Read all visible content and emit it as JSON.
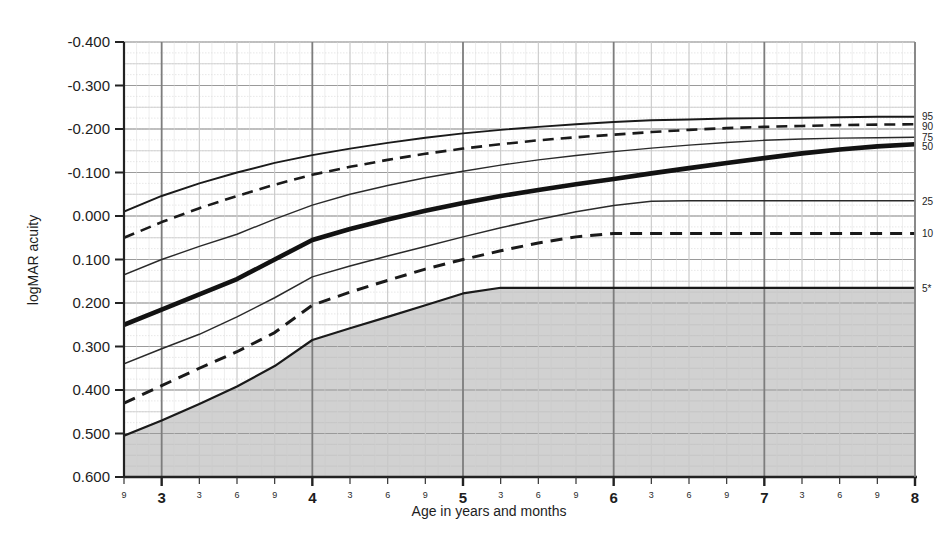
{
  "chart_data": {
    "type": "line",
    "title": "",
    "xlabel": "Age in years and months",
    "ylabel": "logMAR acuity",
    "ylim": [
      -0.4,
      0.6
    ],
    "xlim": [
      2.75,
      8.0
    ],
    "y_inverted": true,
    "grid": true,
    "legend_position": "right-axis-labels",
    "y_ticks": [
      "-0.400",
      "-0.300",
      "-0.200",
      "-0.100",
      "0.000",
      "0.100",
      "0.200",
      "0.300",
      "0.400",
      "0.500",
      "0.600"
    ],
    "y_tick_values": [
      -0.4,
      -0.3,
      -0.2,
      -0.1,
      0.0,
      0.1,
      0.2,
      0.3,
      0.4,
      0.5,
      0.6
    ],
    "x_year_ticks": [
      "3",
      "4",
      "5",
      "6",
      "7",
      "8"
    ],
    "x_year_values": [
      3,
      4,
      5,
      6,
      7,
      8
    ],
    "x_month_ticks": [
      "9",
      "3",
      "6",
      "9",
      "3",
      "6",
      "9",
      "3",
      "6",
      "9",
      "3",
      "6",
      "9",
      "3",
      "6",
      "9"
    ],
    "x_month_values": [
      2.75,
      3.25,
      3.5,
      3.75,
      4.25,
      4.5,
      4.75,
      5.25,
      5.5,
      5.75,
      6.25,
      6.5,
      6.75,
      7.25,
      7.5,
      7.75
    ],
    "shaded_region_label": "below 5th percentile",
    "shaded_region_color": "#cfcfcf",
    "x": [
      2.75,
      3.0,
      3.25,
      3.5,
      3.75,
      4.0,
      4.25,
      4.5,
      4.75,
      5.0,
      5.25,
      5.5,
      5.75,
      6.0,
      6.25,
      6.5,
      6.75,
      7.0,
      7.25,
      7.5,
      7.75,
      8.0
    ],
    "series": [
      {
        "name": "95",
        "label": "95",
        "style": "solid",
        "width": 1.9,
        "color": "#1a1a1a",
        "values": [
          -0.01,
          -0.046,
          -0.075,
          -0.1,
          -0.122,
          -0.14,
          -0.155,
          -0.168,
          -0.18,
          -0.19,
          -0.198,
          -0.205,
          -0.211,
          -0.216,
          -0.22,
          -0.222,
          -0.224,
          -0.225,
          -0.226,
          -0.227,
          -0.228,
          -0.228
        ]
      },
      {
        "name": "90",
        "label": "90",
        "style": "dashed",
        "width": 2.6,
        "color": "#1a1a1a",
        "values": [
          0.05,
          0.014,
          -0.018,
          -0.046,
          -0.072,
          -0.095,
          -0.113,
          -0.129,
          -0.143,
          -0.155,
          -0.165,
          -0.174,
          -0.181,
          -0.187,
          -0.193,
          -0.198,
          -0.202,
          -0.205,
          -0.207,
          -0.209,
          -0.21,
          -0.211
        ]
      },
      {
        "name": "75",
        "label": "75",
        "style": "solid",
        "width": 1.4,
        "color": "#2a2a2a",
        "values": [
          0.135,
          0.1,
          0.07,
          0.042,
          0.007,
          -0.025,
          -0.05,
          -0.07,
          -0.088,
          -0.103,
          -0.117,
          -0.129,
          -0.139,
          -0.148,
          -0.156,
          -0.163,
          -0.169,
          -0.174,
          -0.177,
          -0.179,
          -0.18,
          -0.181
        ]
      },
      {
        "name": "50",
        "label": "50",
        "style": "solid",
        "width": 4.6,
        "color": "#121212",
        "values": [
          0.25,
          0.215,
          0.18,
          0.145,
          0.1,
          0.055,
          0.03,
          0.008,
          -0.012,
          -0.03,
          -0.046,
          -0.06,
          -0.073,
          -0.085,
          -0.098,
          -0.11,
          -0.122,
          -0.133,
          -0.144,
          -0.153,
          -0.16,
          -0.165
        ]
      },
      {
        "name": "25",
        "label": "25",
        "style": "solid",
        "width": 1.5,
        "color": "#2a2a2a",
        "values": [
          0.34,
          0.305,
          0.272,
          0.232,
          0.188,
          0.14,
          0.115,
          0.092,
          0.07,
          0.048,
          0.027,
          0.008,
          -0.01,
          -0.024,
          -0.034,
          -0.035,
          -0.035,
          -0.035,
          -0.035,
          -0.035,
          -0.035,
          -0.035
        ]
      },
      {
        "name": "10",
        "label": "10",
        "style": "dashed",
        "width": 3.0,
        "color": "#1a1a1a",
        "values": [
          0.43,
          0.39,
          0.35,
          0.312,
          0.268,
          0.205,
          0.175,
          0.148,
          0.122,
          0.1,
          0.08,
          0.062,
          0.048,
          0.04,
          0.04,
          0.04,
          0.04,
          0.04,
          0.04,
          0.04,
          0.04,
          0.04
        ]
      },
      {
        "name": "5*",
        "label": "5*",
        "style": "solid",
        "width": 2.2,
        "color": "#1a1a1a",
        "values": [
          0.505,
          0.47,
          0.432,
          0.392,
          0.345,
          0.285,
          0.258,
          0.232,
          0.205,
          0.178,
          0.165,
          0.165,
          0.165,
          0.165,
          0.165,
          0.165,
          0.165,
          0.165,
          0.165,
          0.165,
          0.165,
          0.165
        ]
      }
    ]
  },
  "axes": {
    "y_title": "logMAR acuity",
    "x_title": "Age in years and months"
  },
  "colors": {
    "grid_major": "#9a9a9a",
    "grid_minor": "#c8c8c8",
    "grid_fine": "#d8d8d8",
    "axis": "#222222",
    "shade": "#cfcfcf",
    "text": "#1d1d1d"
  }
}
